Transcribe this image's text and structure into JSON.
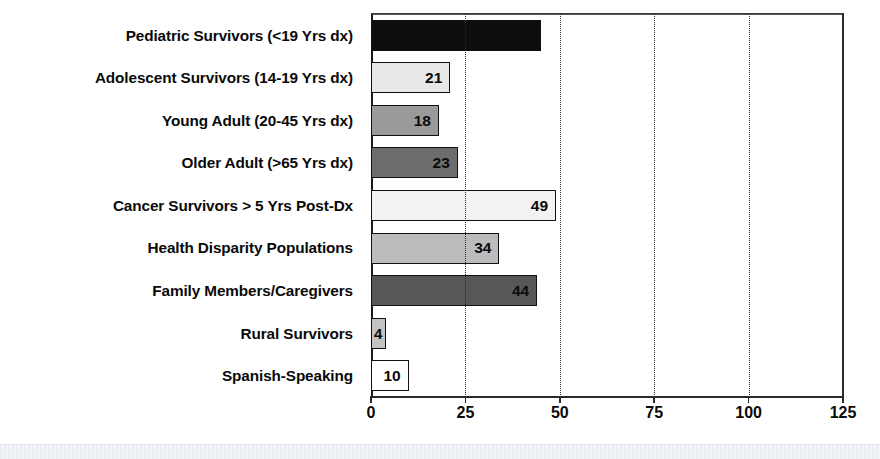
{
  "chart_data": {
    "type": "bar",
    "orientation": "horizontal",
    "title": "",
    "xlabel": "",
    "ylabel": "",
    "xlim": [
      0,
      125
    ],
    "xticks": [
      0,
      25,
      50,
      75,
      100,
      125
    ],
    "xtick_labels": [
      "0",
      "25",
      "50",
      "75",
      "100",
      "125"
    ],
    "gridlines_x": [
      25,
      50,
      75,
      100
    ],
    "grid": true,
    "legend": false,
    "categories": [
      "Pediatric Survivors (<19 Yrs dx)",
      "Adolescent Survivors (14-19 Yrs dx)",
      "Young Adult (20-45 Yrs dx)",
      "Older Adult (>65 Yrs dx)",
      "Cancer Survivors > 5 Yrs Post-Dx",
      "Health Disparity Populations",
      "Family Members/Caregivers",
      "Rural Survivors",
      "Spanish-Speaking"
    ],
    "values": [
      45,
      21,
      18,
      23,
      49,
      34,
      44,
      4,
      10
    ],
    "value_labels": [
      "",
      "21",
      "18",
      "23",
      "49",
      "34",
      "44",
      "4",
      "10"
    ],
    "bar_colors": [
      "#0d0d0d",
      "#e8e8e8",
      "#9a9a9a",
      "#6d6d6d",
      "#f2f2f2",
      "#bcbcbc",
      "#575757",
      "#c3c3c3",
      "#ffffff"
    ],
    "bar_border_color": "#111111",
    "axis_color": "#2a2a2a",
    "text_color": "#0a0a0a",
    "background": "#ffffff"
  },
  "bars": [
    {
      "label": "Pediatric Survivors (<19 Yrs dx)",
      "value": 45,
      "value_label": "",
      "color": "#0d0d0d",
      "show_value": false,
      "tiny": false
    },
    {
      "label": "Adolescent Survivors (14-19 Yrs dx)",
      "value": 21,
      "value_label": "21",
      "color": "#e8e8e8",
      "show_value": true,
      "tiny": false
    },
    {
      "label": "Young Adult (20-45 Yrs dx)",
      "value": 18,
      "value_label": "18",
      "color": "#9a9a9a",
      "show_value": true,
      "tiny": false
    },
    {
      "label": "Older Adult (>65 Yrs dx)",
      "value": 23,
      "value_label": "23",
      "color": "#6d6d6d",
      "show_value": true,
      "tiny": false
    },
    {
      "label": "Cancer Survivors > 5 Yrs Post-Dx",
      "value": 49,
      "value_label": "49",
      "color": "#f2f2f2",
      "show_value": true,
      "tiny": false
    },
    {
      "label": "Health Disparity Populations",
      "value": 34,
      "value_label": "34",
      "color": "#bcbcbc",
      "show_value": true,
      "tiny": false
    },
    {
      "label": "Family Members/Caregivers",
      "value": 44,
      "value_label": "44",
      "color": "#575757",
      "show_value": true,
      "tiny": false
    },
    {
      "label": "Rural Survivors",
      "value": 4,
      "value_label": "4",
      "color": "#c3c3c3",
      "show_value": true,
      "tiny": true
    },
    {
      "label": "Spanish-Speaking",
      "value": 10,
      "value_label": "10",
      "color": "#ffffff",
      "show_value": true,
      "tiny": false
    }
  ],
  "axis": {
    "ticks": [
      "0",
      "25",
      "50",
      "75",
      "100",
      "125"
    ]
  }
}
